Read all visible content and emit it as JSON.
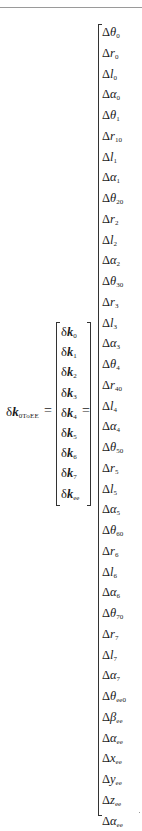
{
  "equation": {
    "lhs": {
      "delta": "δ",
      "symbol": "k",
      "subscript": "0ToEE"
    },
    "equals": "=",
    "middle_vector": [
      {
        "delta": "δ",
        "symbol": "k",
        "subscript": "0"
      },
      {
        "delta": "δ",
        "symbol": "k",
        "subscript": "1"
      },
      {
        "delta": "δ",
        "symbol": "k",
        "subscript": "2"
      },
      {
        "delta": "δ",
        "symbol": "k",
        "subscript": "3"
      },
      {
        "delta": "δ",
        "symbol": "k",
        "subscript": "4"
      },
      {
        "delta": "δ",
        "symbol": "k",
        "subscript": "5"
      },
      {
        "delta": "δ",
        "symbol": "k",
        "subscript": "6"
      },
      {
        "delta": "δ",
        "symbol": "k",
        "subscript": "7"
      },
      {
        "delta": "δ",
        "symbol": "k",
        "subscript": "ee"
      }
    ],
    "right_vector": [
      {
        "delta": "Δ",
        "symbol": "θ",
        "subscript": "0"
      },
      {
        "delta": "Δ",
        "symbol": "r",
        "subscript": "0"
      },
      {
        "delta": "Δ",
        "symbol": "l",
        "subscript": "0"
      },
      {
        "delta": "Δ",
        "symbol": "α",
        "subscript": "0"
      },
      {
        "delta": "Δ",
        "symbol": "θ",
        "subscript": "1"
      },
      {
        "delta": "Δ",
        "symbol": "r",
        "subscript": "10"
      },
      {
        "delta": "Δ",
        "symbol": "l",
        "subscript": "1"
      },
      {
        "delta": "Δ",
        "symbol": "α",
        "subscript": "1"
      },
      {
        "delta": "Δ",
        "symbol": "θ",
        "subscript": "20"
      },
      {
        "delta": "Δ",
        "symbol": "r",
        "subscript": "2"
      },
      {
        "delta": "Δ",
        "symbol": "l",
        "subscript": "2"
      },
      {
        "delta": "Δ",
        "symbol": "α",
        "subscript": "2"
      },
      {
        "delta": "Δ",
        "symbol": "θ",
        "subscript": "30"
      },
      {
        "delta": "Δ",
        "symbol": "r",
        "subscript": "3"
      },
      {
        "delta": "Δ",
        "symbol": "l",
        "subscript": "3"
      },
      {
        "delta": "Δ",
        "symbol": "α",
        "subscript": "3"
      },
      {
        "delta": "Δ",
        "symbol": "θ",
        "subscript": "4"
      },
      {
        "delta": "Δ",
        "symbol": "r",
        "subscript": "40"
      },
      {
        "delta": "Δ",
        "symbol": "l",
        "subscript": "4"
      },
      {
        "delta": "Δ",
        "symbol": "α",
        "subscript": "4"
      },
      {
        "delta": "Δ",
        "symbol": "θ",
        "subscript": "50"
      },
      {
        "delta": "Δ",
        "symbol": "r",
        "subscript": "5"
      },
      {
        "delta": "Δ",
        "symbol": "l",
        "subscript": "5"
      },
      {
        "delta": "Δ",
        "symbol": "α",
        "subscript": "5"
      },
      {
        "delta": "Δ",
        "symbol": "θ",
        "subscript": "60"
      },
      {
        "delta": "Δ",
        "symbol": "r",
        "subscript": "6"
      },
      {
        "delta": "Δ",
        "symbol": "l",
        "subscript": "6"
      },
      {
        "delta": "Δ",
        "symbol": "α",
        "subscript": "6"
      },
      {
        "delta": "Δ",
        "symbol": "θ",
        "subscript": "70"
      },
      {
        "delta": "Δ",
        "symbol": "r",
        "subscript": "7"
      },
      {
        "delta": "Δ",
        "symbol": "l",
        "subscript": "7"
      },
      {
        "delta": "Δ",
        "symbol": "α",
        "subscript": "7"
      },
      {
        "delta": "Δ",
        "symbol": "θ",
        "subscript": "ee0"
      },
      {
        "delta": "Δ",
        "symbol": "β",
        "subscript": "ee"
      },
      {
        "delta": "Δ",
        "symbol": "α",
        "subscript": "ee"
      },
      {
        "delta": "Δ",
        "symbol": "x",
        "subscript": "ee"
      },
      {
        "delta": "Δ",
        "symbol": "y",
        "subscript": "ee"
      },
      {
        "delta": "Δ",
        "symbol": "z",
        "subscript": "ee"
      },
      {
        "delta": "Δ",
        "symbol": "α",
        "subscript": "ee"
      }
    ],
    "trailing_punct": "."
  }
}
